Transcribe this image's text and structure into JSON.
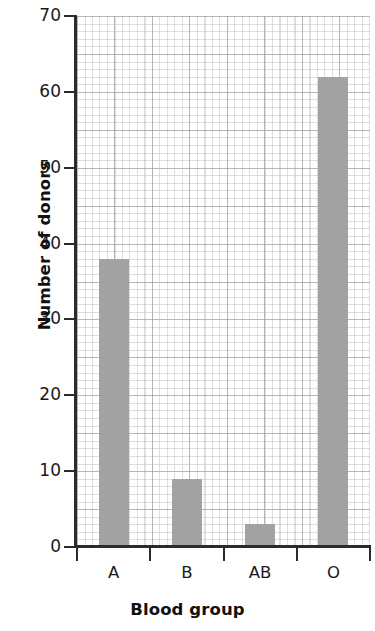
{
  "chart_data": {
    "type": "bar",
    "title": "",
    "categories": [
      "A",
      "B",
      "AB",
      "O"
    ],
    "values": [
      38,
      9,
      3,
      62
    ],
    "xlabel": "Blood group",
    "ylabel": "Number of donors",
    "ylim": [
      0,
      70
    ],
    "yticks": [
      0,
      10,
      20,
      30,
      40,
      50,
      60,
      70
    ],
    "ytick_labels": [
      "0",
      "10",
      "20",
      "30",
      "40",
      "50",
      "60",
      "70"
    ],
    "grid": true,
    "grid_style": "graph-paper minor and major lines",
    "legend": null,
    "bar_color": "#a2a2a2",
    "axis_color": "#2b2b2b",
    "background_color": "#ffffff"
  }
}
